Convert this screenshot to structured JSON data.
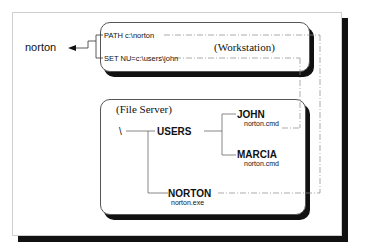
{
  "diagram": {
    "left_label": "norton",
    "workstation": {
      "title": "(Workstation)",
      "lines": [
        "PATH c:\\norton",
        "SET NU=c:\\users\\john"
      ]
    },
    "file_server": {
      "title": "(File Server)",
      "root": "\\",
      "nodes": {
        "users": "USERS",
        "john": "JOHN",
        "john_file": "norton.cmd",
        "marcia": "MARCIA",
        "marcia_file": "norton.cmd",
        "norton": "NORTON",
        "norton_file": "norton.exe"
      }
    }
  }
}
